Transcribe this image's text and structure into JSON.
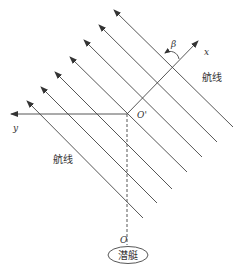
{
  "diagram": {
    "type": "geometry",
    "labels": {
      "x_axis": "x",
      "y_axis": "y",
      "origin_prime": "O'",
      "origin": "O",
      "angle": "β",
      "track_line_right": "航线",
      "track_line_left": "航线",
      "submarine": "潜艇"
    },
    "colors": {
      "line": "#444444",
      "text": "#333333",
      "background": "#ffffff"
    },
    "track_lines": [
      {
        "tip": [
          114,
          10
        ],
        "end": [
          233,
          127
        ]
      },
      {
        "tip": [
          99,
          25
        ],
        "end": [
          217,
          142
        ]
      },
      {
        "tip": [
          84,
          40
        ],
        "end": [
          202,
          157
        ]
      },
      {
        "tip": [
          70,
          57
        ],
        "end": [
          187,
          172
        ]
      },
      {
        "tip": [
          55,
          72
        ],
        "end": [
          172,
          189
        ]
      },
      {
        "tip": [
          41,
          87
        ],
        "end": [
          157,
          203
        ]
      },
      {
        "tip": [
          27,
          101
        ],
        "end": [
          143,
          218
        ]
      }
    ]
  }
}
